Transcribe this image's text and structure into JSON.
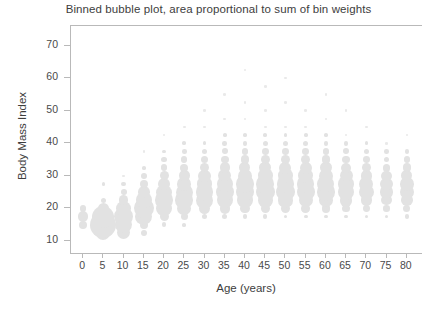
{
  "chart_data": {
    "type": "scatter",
    "title": "Binned bubble plot, area proportional to sum of bin weights",
    "subtitle": "",
    "xlabel": "Age (years)",
    "ylabel": "Body Mass Index",
    "xlim": [
      -3,
      84
    ],
    "ylim": [
      6,
      76
    ],
    "xticks": [
      0,
      5,
      10,
      15,
      20,
      25,
      30,
      35,
      40,
      45,
      50,
      55,
      60,
      65,
      70,
      75,
      80
    ],
    "yticks": [
      10,
      20,
      30,
      40,
      50,
      60,
      70
    ],
    "xticklabels": [
      "0",
      "5",
      "10",
      "15",
      "20",
      "25",
      "30",
      "35",
      "40",
      "45",
      "50",
      "55",
      "60",
      "65",
      "70",
      "75",
      "80"
    ],
    "yticklabels": [
      "10",
      "20",
      "30",
      "40",
      "50",
      "60",
      "70"
    ],
    "grid": false,
    "legend": false,
    "legend_position": "none",
    "marker_color": "#e2e2e2",
    "frame_color": "#b9b9b9",
    "bubble_size_encoding": "area proportional to sum of bin weights",
    "x_bin_step": 5,
    "y_bin_step": 2.5,
    "max_weight": 100,
    "points": [
      {
        "x": 0,
        "y": 15.0,
        "w": 9
      },
      {
        "x": 0,
        "y": 17.5,
        "w": 16
      },
      {
        "x": 0,
        "y": 20.0,
        "w": 6
      },
      {
        "x": 5,
        "y": 12.5,
        "w": 30
      },
      {
        "x": 5,
        "y": 15.0,
        "w": 100
      },
      {
        "x": 5,
        "y": 17.5,
        "w": 72
      },
      {
        "x": 5,
        "y": 20.0,
        "w": 18
      },
      {
        "x": 5,
        "y": 22.5,
        "w": 4
      },
      {
        "x": 5,
        "y": 27.5,
        "w": 2
      },
      {
        "x": 10,
        "y": 12.5,
        "w": 26
      },
      {
        "x": 10,
        "y": 15.0,
        "w": 44
      },
      {
        "x": 10,
        "y": 17.5,
        "w": 56
      },
      {
        "x": 10,
        "y": 20.0,
        "w": 34
      },
      {
        "x": 10,
        "y": 22.5,
        "w": 14
      },
      {
        "x": 10,
        "y": 25.0,
        "w": 5
      },
      {
        "x": 10,
        "y": 27.5,
        "w": 3
      },
      {
        "x": 10,
        "y": 30.0,
        "w": 1
      },
      {
        "x": 15,
        "y": 12.5,
        "w": 6
      },
      {
        "x": 15,
        "y": 15.0,
        "w": 10
      },
      {
        "x": 15,
        "y": 17.5,
        "w": 44
      },
      {
        "x": 15,
        "y": 20.0,
        "w": 58
      },
      {
        "x": 15,
        "y": 22.5,
        "w": 40
      },
      {
        "x": 15,
        "y": 25.0,
        "w": 20
      },
      {
        "x": 15,
        "y": 27.5,
        "w": 10
      },
      {
        "x": 15,
        "y": 30.0,
        "w": 5
      },
      {
        "x": 15,
        "y": 32.5,
        "w": 2
      },
      {
        "x": 15,
        "y": 37.5,
        "w": 1
      },
      {
        "x": 20,
        "y": 15.0,
        "w": 3
      },
      {
        "x": 20,
        "y": 17.5,
        "w": 12
      },
      {
        "x": 20,
        "y": 20.0,
        "w": 34
      },
      {
        "x": 20,
        "y": 22.5,
        "w": 46
      },
      {
        "x": 20,
        "y": 25.0,
        "w": 34
      },
      {
        "x": 20,
        "y": 27.5,
        "w": 22
      },
      {
        "x": 20,
        "y": 30.0,
        "w": 12
      },
      {
        "x": 20,
        "y": 32.5,
        "w": 7
      },
      {
        "x": 20,
        "y": 35.0,
        "w": 4
      },
      {
        "x": 20,
        "y": 37.5,
        "w": 2
      },
      {
        "x": 20,
        "y": 42.5,
        "w": 1
      },
      {
        "x": 25,
        "y": 15.0,
        "w": 2
      },
      {
        "x": 25,
        "y": 17.5,
        "w": 8
      },
      {
        "x": 25,
        "y": 20.0,
        "w": 28
      },
      {
        "x": 25,
        "y": 22.5,
        "w": 46
      },
      {
        "x": 25,
        "y": 25.0,
        "w": 42
      },
      {
        "x": 25,
        "y": 27.5,
        "w": 28
      },
      {
        "x": 25,
        "y": 30.0,
        "w": 17
      },
      {
        "x": 25,
        "y": 32.5,
        "w": 10
      },
      {
        "x": 25,
        "y": 35.0,
        "w": 6
      },
      {
        "x": 25,
        "y": 37.5,
        "w": 3
      },
      {
        "x": 25,
        "y": 40.0,
        "w": 2
      },
      {
        "x": 25,
        "y": 45.0,
        "w": 1
      },
      {
        "x": 30,
        "y": 17.5,
        "w": 5
      },
      {
        "x": 30,
        "y": 20.0,
        "w": 20
      },
      {
        "x": 30,
        "y": 22.5,
        "w": 42
      },
      {
        "x": 30,
        "y": 25.0,
        "w": 46
      },
      {
        "x": 30,
        "y": 27.5,
        "w": 34
      },
      {
        "x": 30,
        "y": 30.0,
        "w": 22
      },
      {
        "x": 30,
        "y": 32.5,
        "w": 13
      },
      {
        "x": 30,
        "y": 35.0,
        "w": 8
      },
      {
        "x": 30,
        "y": 37.5,
        "w": 4
      },
      {
        "x": 30,
        "y": 40.0,
        "w": 2
      },
      {
        "x": 30,
        "y": 45.0,
        "w": 1
      },
      {
        "x": 30,
        "y": 50.0,
        "w": 1
      },
      {
        "x": 35,
        "y": 17.5,
        "w": 4
      },
      {
        "x": 35,
        "y": 20.0,
        "w": 16
      },
      {
        "x": 35,
        "y": 22.5,
        "w": 40
      },
      {
        "x": 35,
        "y": 25.0,
        "w": 50
      },
      {
        "x": 35,
        "y": 27.5,
        "w": 40
      },
      {
        "x": 35,
        "y": 30.0,
        "w": 26
      },
      {
        "x": 35,
        "y": 32.5,
        "w": 16
      },
      {
        "x": 35,
        "y": 35.0,
        "w": 9
      },
      {
        "x": 35,
        "y": 37.5,
        "w": 5
      },
      {
        "x": 35,
        "y": 40.0,
        "w": 3
      },
      {
        "x": 35,
        "y": 42.5,
        "w": 2
      },
      {
        "x": 35,
        "y": 47.5,
        "w": 1
      },
      {
        "x": 35,
        "y": 55.0,
        "w": 1
      },
      {
        "x": 40,
        "y": 17.5,
        "w": 3
      },
      {
        "x": 40,
        "y": 20.0,
        "w": 14
      },
      {
        "x": 40,
        "y": 22.5,
        "w": 36
      },
      {
        "x": 40,
        "y": 25.0,
        "w": 52
      },
      {
        "x": 40,
        "y": 27.5,
        "w": 44
      },
      {
        "x": 40,
        "y": 30.0,
        "w": 30
      },
      {
        "x": 40,
        "y": 32.5,
        "w": 18
      },
      {
        "x": 40,
        "y": 35.0,
        "w": 11
      },
      {
        "x": 40,
        "y": 37.5,
        "w": 6
      },
      {
        "x": 40,
        "y": 40.0,
        "w": 3
      },
      {
        "x": 40,
        "y": 42.5,
        "w": 2
      },
      {
        "x": 40,
        "y": 47.5,
        "w": 1
      },
      {
        "x": 40,
        "y": 52.5,
        "w": 1
      },
      {
        "x": 40,
        "y": 62.5,
        "w": 1
      },
      {
        "x": 45,
        "y": 17.5,
        "w": 3
      },
      {
        "x": 45,
        "y": 20.0,
        "w": 13
      },
      {
        "x": 45,
        "y": 22.5,
        "w": 34
      },
      {
        "x": 45,
        "y": 25.0,
        "w": 52
      },
      {
        "x": 45,
        "y": 27.5,
        "w": 46
      },
      {
        "x": 45,
        "y": 30.0,
        "w": 32
      },
      {
        "x": 45,
        "y": 32.5,
        "w": 20
      },
      {
        "x": 45,
        "y": 35.0,
        "w": 12
      },
      {
        "x": 45,
        "y": 37.5,
        "w": 7
      },
      {
        "x": 45,
        "y": 40.0,
        "w": 4
      },
      {
        "x": 45,
        "y": 42.5,
        "w": 2
      },
      {
        "x": 45,
        "y": 45.0,
        "w": 1
      },
      {
        "x": 45,
        "y": 50.0,
        "w": 1
      },
      {
        "x": 45,
        "y": 57.5,
        "w": 1
      },
      {
        "x": 50,
        "y": 17.5,
        "w": 2
      },
      {
        "x": 50,
        "y": 20.0,
        "w": 12
      },
      {
        "x": 50,
        "y": 22.5,
        "w": 32
      },
      {
        "x": 50,
        "y": 25.0,
        "w": 50
      },
      {
        "x": 50,
        "y": 27.5,
        "w": 46
      },
      {
        "x": 50,
        "y": 30.0,
        "w": 32
      },
      {
        "x": 50,
        "y": 32.5,
        "w": 21
      },
      {
        "x": 50,
        "y": 35.0,
        "w": 13
      },
      {
        "x": 50,
        "y": 37.5,
        "w": 7
      },
      {
        "x": 50,
        "y": 40.0,
        "w": 4
      },
      {
        "x": 50,
        "y": 42.5,
        "w": 2
      },
      {
        "x": 50,
        "y": 45.0,
        "w": 1
      },
      {
        "x": 50,
        "y": 52.5,
        "w": 1
      },
      {
        "x": 50,
        "y": 60.0,
        "w": 1
      },
      {
        "x": 55,
        "y": 17.5,
        "w": 2
      },
      {
        "x": 55,
        "y": 20.0,
        "w": 11
      },
      {
        "x": 55,
        "y": 22.5,
        "w": 30
      },
      {
        "x": 55,
        "y": 25.0,
        "w": 48
      },
      {
        "x": 55,
        "y": 27.5,
        "w": 46
      },
      {
        "x": 55,
        "y": 30.0,
        "w": 33
      },
      {
        "x": 55,
        "y": 32.5,
        "w": 21
      },
      {
        "x": 55,
        "y": 35.0,
        "w": 13
      },
      {
        "x": 55,
        "y": 37.5,
        "w": 7
      },
      {
        "x": 55,
        "y": 40.0,
        "w": 4
      },
      {
        "x": 55,
        "y": 42.5,
        "w": 2
      },
      {
        "x": 55,
        "y": 45.0,
        "w": 1
      },
      {
        "x": 55,
        "y": 50.0,
        "w": 1
      },
      {
        "x": 60,
        "y": 17.5,
        "w": 2
      },
      {
        "x": 60,
        "y": 20.0,
        "w": 10
      },
      {
        "x": 60,
        "y": 22.5,
        "w": 28
      },
      {
        "x": 60,
        "y": 25.0,
        "w": 44
      },
      {
        "x": 60,
        "y": 27.5,
        "w": 42
      },
      {
        "x": 60,
        "y": 30.0,
        "w": 30
      },
      {
        "x": 60,
        "y": 32.5,
        "w": 19
      },
      {
        "x": 60,
        "y": 35.0,
        "w": 11
      },
      {
        "x": 60,
        "y": 37.5,
        "w": 6
      },
      {
        "x": 60,
        "y": 40.0,
        "w": 3
      },
      {
        "x": 60,
        "y": 42.5,
        "w": 2
      },
      {
        "x": 60,
        "y": 47.5,
        "w": 1
      },
      {
        "x": 60,
        "y": 55.0,
        "w": 1
      },
      {
        "x": 65,
        "y": 17.5,
        "w": 2
      },
      {
        "x": 65,
        "y": 20.0,
        "w": 9
      },
      {
        "x": 65,
        "y": 22.5,
        "w": 24
      },
      {
        "x": 65,
        "y": 25.0,
        "w": 38
      },
      {
        "x": 65,
        "y": 27.5,
        "w": 36
      },
      {
        "x": 65,
        "y": 30.0,
        "w": 25
      },
      {
        "x": 65,
        "y": 32.5,
        "w": 15
      },
      {
        "x": 65,
        "y": 35.0,
        "w": 9
      },
      {
        "x": 65,
        "y": 37.5,
        "w": 5
      },
      {
        "x": 65,
        "y": 40.0,
        "w": 3
      },
      {
        "x": 65,
        "y": 42.5,
        "w": 1
      },
      {
        "x": 65,
        "y": 50.0,
        "w": 1
      },
      {
        "x": 70,
        "y": 17.5,
        "w": 2
      },
      {
        "x": 70,
        "y": 20.0,
        "w": 7
      },
      {
        "x": 70,
        "y": 22.5,
        "w": 20
      },
      {
        "x": 70,
        "y": 25.0,
        "w": 32
      },
      {
        "x": 70,
        "y": 27.5,
        "w": 30
      },
      {
        "x": 70,
        "y": 30.0,
        "w": 20
      },
      {
        "x": 70,
        "y": 32.5,
        "w": 12
      },
      {
        "x": 70,
        "y": 35.0,
        "w": 7
      },
      {
        "x": 70,
        "y": 37.5,
        "w": 4
      },
      {
        "x": 70,
        "y": 40.0,
        "w": 2
      },
      {
        "x": 70,
        "y": 45.0,
        "w": 1
      },
      {
        "x": 75,
        "y": 17.5,
        "w": 2
      },
      {
        "x": 75,
        "y": 20.0,
        "w": 6
      },
      {
        "x": 75,
        "y": 22.5,
        "w": 16
      },
      {
        "x": 75,
        "y": 25.0,
        "w": 26
      },
      {
        "x": 75,
        "y": 27.5,
        "w": 24
      },
      {
        "x": 75,
        "y": 30.0,
        "w": 16
      },
      {
        "x": 75,
        "y": 32.5,
        "w": 9
      },
      {
        "x": 75,
        "y": 35.0,
        "w": 5
      },
      {
        "x": 75,
        "y": 37.5,
        "w": 3
      },
      {
        "x": 75,
        "y": 40.0,
        "w": 1
      },
      {
        "x": 80,
        "y": 17.5,
        "w": 3
      },
      {
        "x": 80,
        "y": 20.0,
        "w": 8
      },
      {
        "x": 80,
        "y": 22.5,
        "w": 20
      },
      {
        "x": 80,
        "y": 25.0,
        "w": 30
      },
      {
        "x": 80,
        "y": 27.5,
        "w": 28
      },
      {
        "x": 80,
        "y": 30.0,
        "w": 19
      },
      {
        "x": 80,
        "y": 32.5,
        "w": 11
      },
      {
        "x": 80,
        "y": 35.0,
        "w": 6
      },
      {
        "x": 80,
        "y": 37.5,
        "w": 3
      },
      {
        "x": 80,
        "y": 42.5,
        "w": 1
      }
    ]
  }
}
